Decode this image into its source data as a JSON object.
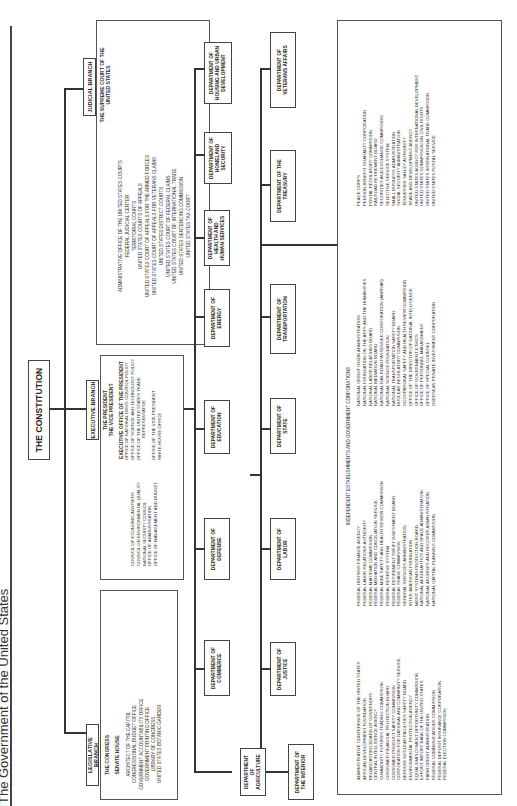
{
  "title": "The Government of the United States",
  "root": {
    "label": "THE CONSTITUTION"
  },
  "branches": {
    "legislative": {
      "label": "LEGISLATIVE BRANCH",
      "head": "THE CONGRESS",
      "chambers": "SENATE    HOUSE",
      "items": [
        "ARCHITECT OF THE CAPITOL",
        "CONGRESSIONAL BUDGET OFFICE",
        "GOVERNMENT ACCOUNTABILITY OFFICE",
        "GOVERNMENT PRINTING OFFICE",
        "LIBRARY OF CONGRESS",
        "UNITED STATES BOTANIC GARDEN"
      ]
    },
    "executive": {
      "label": "EXECUTIVE BRANCH",
      "president": "THE PRESIDENT",
      "vice_president": "THE VICE PRESIDENT",
      "eop_heading": "EXECUTIVE OFFICE OF THE PRESIDENT",
      "eop_left": [
        "COUNCIL OF ECONOMIC ADVISERS",
        "COUNCIL ON ENVIRONMENTAL QUALITY",
        "NATIONAL SECURITY COUNCIL",
        "OFFICE OF ADMINISTRATION",
        "OFFICE OF MANAGEMENT AND BUDGET"
      ],
      "eop_right": [
        "OFFICE OF NATIONAL DRUG CONTROL POLICY",
        "OFFICE OF SCIENCE AND TECHNOLOGY POLICY",
        "OFFICE OF THE UNITED STATES TRADE",
        "REPRESENTATIVE",
        "",
        "OFFICE OF THE VICE PRESIDENT",
        "WHITE HOUSE OFFICE"
      ]
    },
    "judicial": {
      "label": "JUDICIAL BRANCH",
      "head": "THE SUPREME COURT OF THE UNITED STATES",
      "items": [
        "ADMINISTRATIVE OFFICE OF THE UNITED STATES COURTS",
        "FEDERAL JUDICIAL CENTER",
        "TERRITORIAL COURTS",
        "UNITED STATES COURTS OF APPEALS",
        "UNITED STATES COURT OF APPEALS FOR THE ARMED FORCES",
        "UNITED STATES COURT OF APPEALS FOR VETERANS CLAIMS",
        "UNITED STATES DISTRICT COURTS",
        "UNITED STATES COURT OF FEDERAL CLAIMS",
        "UNITED STATES COURT OF INTERNATIONAL TRADE",
        "UNITED STATES SENTENCING COMMISSION",
        "UNITED STATES TAX COURT"
      ]
    }
  },
  "departments": {
    "row1": [
      "DEPARTMENT OF AGRICULTURE",
      "DEPARTMENT OF COMMERCE",
      "DEPARTMENT OF DEFENSE",
      "DEPARTMENT OF EDUCATION",
      "DEPARTMENT OF ENERGY",
      "DEPARTMENT OF HEALTH AND HUMAN SERVICES",
      "DEPARTMENT OF HOMELAND SECURITY",
      "DEPARTMENT OF HOUSING AND URBAN DEVELOPMENT"
    ],
    "row2": [
      "DEPARTMENT OF THE INTERIOR",
      "DEPARTMENT OF JUSTICE",
      "DEPARTMENT OF LABOR",
      "DEPARTMENT OF STATE",
      "DEPARTMENT OF TRANSPORTATION",
      "DEPARTMENT OF THE TREASURY",
      "DEPARTMENT OF VETERANS AFFAIRS"
    ]
  },
  "independent": {
    "heading": "INDEPENDENT ESTABLISHMENTS AND GOVERNMENT CORPORATIONS",
    "col1": [
      "ADMINISTRATIVE CONFERENCE OF THE UNITED STATES",
      "AFRICAN DEVELOPMENT FOUNDATION",
      "BROADCASTING BOARD OF GOVERNORS",
      "CENTRAL INTELLIGENCE AGENCY",
      "COMMODITY FUTURES TRADING COMMISSION",
      "CONSUMER FINANCIAL PROTECTION BOARD",
      "CONSUMER PRODUCT SAFETY COMMISSION",
      "CORPORATION FOR NATIONAL AND COMMUNITY SERVICE",
      "DEFENSE NUCLEAR FACILITIES SAFETY BOARD",
      "ENVIRONMENTAL PROTECTION AGENCY",
      "EQUAL EMPLOYMENT OPPORTUNITY COMMISSION",
      "EXPORT-IMPORT BANK OF THE UNITED STATES",
      "FARM CREDIT ADMINISTRATION",
      "FEDERAL COMMUNICATIONS COMMISSION",
      "FEDERAL DEPOSIT INSURANCE CORPORATION",
      "FEDERAL ELECTION COMMISSION"
    ],
    "col2": [
      "FEDERAL HOUSING FINANCE AGENCY",
      "FEDERAL LABOR RELATIONS AUTHORITY",
      "FEDERAL MARITIME COMMISSION",
      "FEDERAL MEDIATION AND CONCILIATION SERVICE",
      "FEDERAL MINE SAFETY AND HEALTH REVIEW COMMISSION",
      "FEDERAL RESERVE SYSTEM",
      "FEDERAL RETIREMENT THRIFT INVESTMENT BOARD",
      "FEDERAL TRADE COMMISSION",
      "GENERAL SERVICES ADMINISTRATION",
      "INTER-AMERICAN FOUNDATION",
      "MERIT SYSTEMS PROTECTION BOARD",
      "NATIONAL AERONAUTICS AND SPACE ADMINISTRATION",
      "NATIONAL ARCHIVES AND RECORDS ADMINISTRATION",
      "NATIONAL CAPITAL PLANNING COMMISSION"
    ],
    "col3": [
      "NATIONAL CREDIT UNION ADMINISTRATION",
      "NATIONAL FOUNDATION ON THE ARTS AND THE HUMANITIES",
      "NATIONAL LABOR RELATIONS BOARD",
      "NATIONAL MEDIATION BOARD",
      "NATIONAL RAILROAD PASSENGER CORPORATION (AMTRAK)",
      "NATIONAL SCIENCE FOUNDATION",
      "NATIONAL TRANSPORTATION SAFETY BOARD",
      "NUCLEAR REGULATORY COMMISSION",
      "OCCUPATIONAL SAFETY AND HEALTH REVIEW COMMISSION",
      "OFFICE OF THE DIRECTOR OF NATIONAL INTELLIGENCE",
      "OFFICE OF GOVERNMENT ETHICS",
      "OFFICE OF PERSONNEL MANAGEMENT",
      "OFFICE OF SPECIAL COUNSEL",
      "OVERSEAS PRIVATE INVESTMENT CORPORATION"
    ],
    "col4": [
      "PEACE CORPS",
      "PENSION BENEFIT GUARANTY CORPORATION",
      "POSTAL REGULATORY COMMISSION",
      "RAILROAD RETIREMENT BOARD",
      "SECURITIES AND EXCHANGE COMMISSION",
      "SELECTIVE SERVICE SYSTEM",
      "SMALL BUSINESS ADMINISTRATION",
      "SOCIAL SECURITY ADMINISTRATION",
      "TENNESSEE VALLEY AUTHORITY",
      "TRADE AND DEVELOPMENT AGENCY",
      "UNITED STATES AGENCY FOR INTERNATIONAL DEVELOPMENT",
      "UNITED STATES COMMISSION ON CIVIL RIGHTS",
      "UNITED STATES INTERNATIONAL TRADE COMMISSION",
      "UNITED STATES POSTAL SERVICE"
    ]
  }
}
